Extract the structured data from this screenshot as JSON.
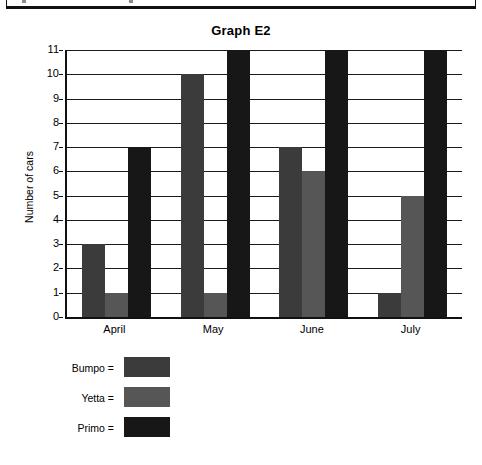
{
  "top_strip": {
    "name": "cut-off-toolbar"
  },
  "chart_data": {
    "type": "bar",
    "title": "Graph E2",
    "xlabel": "",
    "ylabel": "Number of cars",
    "categories": [
      "April",
      "May",
      "June",
      "July"
    ],
    "series": [
      {
        "name": "Bumpo",
        "color": "#3b3b3b",
        "values": [
          3,
          10,
          7,
          1
        ]
      },
      {
        "name": "Yetta",
        "color": "#565656",
        "values": [
          1,
          1,
          6,
          5
        ]
      },
      {
        "name": "Primo",
        "color": "#171717",
        "values": [
          7,
          11,
          11,
          11
        ]
      }
    ],
    "ylim": [
      0,
      11
    ],
    "yticks": [
      0,
      1,
      2,
      3,
      4,
      5,
      6,
      7,
      8,
      9,
      10,
      11
    ],
    "ytick_labels": [
      "0",
      "1",
      "2",
      "3",
      "4",
      "5",
      "6",
      "7",
      "8",
      "9",
      "10",
      "11"
    ],
    "grid": true,
    "legend_position": "below-left",
    "legend_separator": "="
  },
  "legend": {
    "entries": [
      {
        "label": "Bumpo =",
        "color": "#3b3b3b"
      },
      {
        "label": "Yetta =",
        "color": "#565656"
      },
      {
        "label": "Primo =",
        "color": "#171717"
      }
    ]
  }
}
